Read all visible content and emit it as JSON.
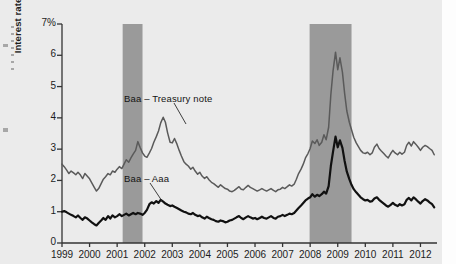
{
  "figure": {
    "background_color": "#ebebeb",
    "plot_background_color": "#ebebeb",
    "recession_band_color": "#9a9a9a",
    "axis_color": "#333333"
  },
  "axes": {
    "y_title": "Interest rate",
    "y_top_label": "7%",
    "y_tick_labels": [
      "0",
      "1",
      "2",
      "3",
      "4",
      "5",
      "6",
      "7%"
    ],
    "x_tick_labels": [
      "1999",
      "2000",
      "2001",
      "2002",
      "2003",
      "2004",
      "2005",
      "2006",
      "2007",
      "2008",
      "2009",
      "2010",
      "2011",
      "2012"
    ]
  },
  "annotations": [
    {
      "name": "baa-treasury-label",
      "text": "Baa – Treasury note",
      "x": 124,
      "y": 93
    },
    {
      "name": "baa-aaa-label",
      "text": "Baa – Aaa",
      "x": 124,
      "y": 173
    }
  ],
  "chart_data": {
    "type": "line",
    "title": "",
    "xlabel": "",
    "ylabel": "Interest rate",
    "xlim": [
      1999.0,
      2012.6
    ],
    "ylim": [
      0,
      7
    ],
    "yunit": "percent",
    "grid": false,
    "legend": "inline-annotations",
    "shaded_regions": [
      {
        "label": "recession",
        "start": 2001.2,
        "end": 2001.92,
        "color": "#9a9a9a"
      },
      {
        "label": "recession",
        "start": 2007.98,
        "end": 2009.5,
        "color": "#9a9a9a"
      }
    ],
    "series": [
      {
        "name": "Baa – Treasury note",
        "color": "#5a5a5a",
        "width": 1.5,
        "x": [
          1999.0,
          1999.08,
          1999.17,
          1999.25,
          1999.33,
          1999.42,
          1999.5,
          1999.58,
          1999.67,
          1999.75,
          1999.83,
          1999.92,
          2000.0,
          2000.08,
          2000.17,
          2000.25,
          2000.33,
          2000.42,
          2000.5,
          2000.58,
          2000.67,
          2000.75,
          2000.83,
          2000.92,
          2001.0,
          2001.08,
          2001.17,
          2001.25,
          2001.33,
          2001.42,
          2001.5,
          2001.58,
          2001.67,
          2001.75,
          2001.83,
          2001.92,
          2002.0,
          2002.08,
          2002.17,
          2002.25,
          2002.33,
          2002.42,
          2002.5,
          2002.58,
          2002.67,
          2002.75,
          2002.83,
          2002.92,
          2003.0,
          2003.08,
          2003.17,
          2003.25,
          2003.33,
          2003.42,
          2003.5,
          2003.58,
          2003.67,
          2003.75,
          2003.83,
          2003.92,
          2004.0,
          2004.08,
          2004.17,
          2004.25,
          2004.33,
          2004.42,
          2004.5,
          2004.58,
          2004.67,
          2004.75,
          2004.83,
          2004.92,
          2005.0,
          2005.08,
          2005.17,
          2005.25,
          2005.33,
          2005.42,
          2005.5,
          2005.58,
          2005.67,
          2005.75,
          2005.83,
          2005.92,
          2006.0,
          2006.08,
          2006.17,
          2006.25,
          2006.33,
          2006.42,
          2006.5,
          2006.58,
          2006.67,
          2006.75,
          2006.83,
          2006.92,
          2007.0,
          2007.08,
          2007.17,
          2007.25,
          2007.33,
          2007.42,
          2007.5,
          2007.58,
          2007.67,
          2007.75,
          2007.83,
          2007.92,
          2008.0,
          2008.08,
          2008.17,
          2008.25,
          2008.33,
          2008.42,
          2008.5,
          2008.58,
          2008.67,
          2008.75,
          2008.83,
          2008.92,
          2009.0,
          2009.08,
          2009.17,
          2009.25,
          2009.33,
          2009.42,
          2009.5,
          2009.58,
          2009.67,
          2009.75,
          2009.83,
          2009.92,
          2010.0,
          2010.08,
          2010.17,
          2010.25,
          2010.33,
          2010.42,
          2010.5,
          2010.58,
          2010.67,
          2010.75,
          2010.83,
          2010.92,
          2011.0,
          2011.08,
          2011.17,
          2011.25,
          2011.33,
          2011.42,
          2011.5,
          2011.58,
          2011.67,
          2011.75,
          2011.83,
          2011.92,
          2012.0,
          2012.08,
          2012.17,
          2012.25,
          2012.33,
          2012.42,
          2012.5
        ],
        "y": [
          2.52,
          2.44,
          2.33,
          2.22,
          2.3,
          2.24,
          2.18,
          2.26,
          2.17,
          2.06,
          2.22,
          2.13,
          2.05,
          1.92,
          1.78,
          1.66,
          1.74,
          1.9,
          2.04,
          2.12,
          2.22,
          2.18,
          2.3,
          2.26,
          2.36,
          2.44,
          2.38,
          2.52,
          2.66,
          2.58,
          2.72,
          2.84,
          2.96,
          3.24,
          3.06,
          2.88,
          2.78,
          2.74,
          2.88,
          3.02,
          3.22,
          3.4,
          3.58,
          3.84,
          4.02,
          3.86,
          3.52,
          3.22,
          3.2,
          3.34,
          3.16,
          2.96,
          2.78,
          2.6,
          2.52,
          2.46,
          2.36,
          2.42,
          2.3,
          2.2,
          2.26,
          2.14,
          2.06,
          2.12,
          2.02,
          1.94,
          1.9,
          1.84,
          1.78,
          1.86,
          1.8,
          1.74,
          1.72,
          1.66,
          1.64,
          1.68,
          1.74,
          1.8,
          1.72,
          1.7,
          1.78,
          1.84,
          1.78,
          1.74,
          1.7,
          1.66,
          1.7,
          1.74,
          1.7,
          1.66,
          1.7,
          1.74,
          1.68,
          1.64,
          1.7,
          1.72,
          1.78,
          1.74,
          1.8,
          1.86,
          1.82,
          1.88,
          2.04,
          2.22,
          2.36,
          2.52,
          2.72,
          2.86,
          3.02,
          3.26,
          3.18,
          3.3,
          3.12,
          3.22,
          3.46,
          3.3,
          3.7,
          4.74,
          5.5,
          6.1,
          5.54,
          5.92,
          5.46,
          4.78,
          4.22,
          3.86,
          3.62,
          3.38,
          3.2,
          3.08,
          2.96,
          2.88,
          2.86,
          2.9,
          2.82,
          2.88,
          3.06,
          3.16,
          3.02,
          2.94,
          2.86,
          2.78,
          2.72,
          2.86,
          2.96,
          2.88,
          2.82,
          2.9,
          2.84,
          2.9,
          3.12,
          3.22,
          3.1,
          3.24,
          3.16,
          3.06,
          2.96,
          3.06,
          3.12,
          3.08,
          3.02,
          2.96,
          2.82
        ]
      },
      {
        "name": "Baa – Aaa",
        "color": "#111111",
        "width": 2.2,
        "x": [
          1999.0,
          1999.08,
          1999.17,
          1999.25,
          1999.33,
          1999.42,
          1999.5,
          1999.58,
          1999.67,
          1999.75,
          1999.83,
          1999.92,
          2000.0,
          2000.08,
          2000.17,
          2000.25,
          2000.33,
          2000.42,
          2000.5,
          2000.58,
          2000.67,
          2000.75,
          2000.83,
          2000.92,
          2001.0,
          2001.08,
          2001.17,
          2001.25,
          2001.33,
          2001.42,
          2001.5,
          2001.58,
          2001.67,
          2001.75,
          2001.83,
          2001.92,
          2002.0,
          2002.08,
          2002.17,
          2002.25,
          2002.33,
          2002.42,
          2002.5,
          2002.58,
          2002.67,
          2002.75,
          2002.83,
          2002.92,
          2003.0,
          2003.08,
          2003.17,
          2003.25,
          2003.33,
          2003.42,
          2003.5,
          2003.58,
          2003.67,
          2003.75,
          2003.83,
          2003.92,
          2004.0,
          2004.08,
          2004.17,
          2004.25,
          2004.33,
          2004.42,
          2004.5,
          2004.58,
          2004.67,
          2004.75,
          2004.83,
          2004.92,
          2005.0,
          2005.08,
          2005.17,
          2005.25,
          2005.33,
          2005.42,
          2005.5,
          2005.58,
          2005.67,
          2005.75,
          2005.83,
          2005.92,
          2006.0,
          2006.08,
          2006.17,
          2006.25,
          2006.33,
          2006.42,
          2006.5,
          2006.58,
          2006.67,
          2006.75,
          2006.83,
          2006.92,
          2007.0,
          2007.08,
          2007.17,
          2007.25,
          2007.33,
          2007.42,
          2007.5,
          2007.58,
          2007.67,
          2007.75,
          2007.83,
          2007.92,
          2008.0,
          2008.08,
          2008.17,
          2008.25,
          2008.33,
          2008.42,
          2008.5,
          2008.58,
          2008.67,
          2008.75,
          2008.83,
          2008.92,
          2009.0,
          2009.08,
          2009.17,
          2009.25,
          2009.33,
          2009.42,
          2009.5,
          2009.58,
          2009.67,
          2009.75,
          2009.83,
          2009.92,
          2010.0,
          2010.08,
          2010.17,
          2010.25,
          2010.33,
          2010.42,
          2010.5,
          2010.58,
          2010.67,
          2010.75,
          2010.83,
          2010.92,
          2011.0,
          2011.08,
          2011.17,
          2011.25,
          2011.33,
          2011.42,
          2011.5,
          2011.58,
          2011.67,
          2011.75,
          2011.83,
          2011.92,
          2012.0,
          2012.08,
          2012.17,
          2012.25,
          2012.33,
          2012.42,
          2012.5
        ],
        "y": [
          1.0,
          1.02,
          0.98,
          0.94,
          0.9,
          0.86,
          0.82,
          0.88,
          0.8,
          0.74,
          0.82,
          0.78,
          0.72,
          0.66,
          0.6,
          0.56,
          0.64,
          0.72,
          0.8,
          0.74,
          0.86,
          0.78,
          0.88,
          0.82,
          0.86,
          0.92,
          0.86,
          0.9,
          0.94,
          0.88,
          0.92,
          0.96,
          0.92,
          0.96,
          0.94,
          0.9,
          0.96,
          1.06,
          1.24,
          1.3,
          1.26,
          1.34,
          1.28,
          1.38,
          1.32,
          1.26,
          1.22,
          1.18,
          1.2,
          1.16,
          1.12,
          1.08,
          1.04,
          1.0,
          0.98,
          0.94,
          0.92,
          0.96,
          0.9,
          0.86,
          0.88,
          0.82,
          0.78,
          0.84,
          0.8,
          0.76,
          0.74,
          0.7,
          0.68,
          0.72,
          0.7,
          0.66,
          0.68,
          0.72,
          0.74,
          0.78,
          0.82,
          0.86,
          0.8,
          0.76,
          0.82,
          0.86,
          0.82,
          0.78,
          0.8,
          0.76,
          0.8,
          0.84,
          0.8,
          0.78,
          0.82,
          0.86,
          0.8,
          0.78,
          0.84,
          0.86,
          0.9,
          0.86,
          0.9,
          0.94,
          0.92,
          0.96,
          1.04,
          1.12,
          1.2,
          1.28,
          1.36,
          1.42,
          1.46,
          1.56,
          1.48,
          1.54,
          1.5,
          1.56,
          1.64,
          1.58,
          1.82,
          2.46,
          2.92,
          3.4,
          3.06,
          3.28,
          3.04,
          2.62,
          2.28,
          2.04,
          1.86,
          1.72,
          1.62,
          1.54,
          1.46,
          1.4,
          1.36,
          1.38,
          1.32,
          1.34,
          1.42,
          1.46,
          1.38,
          1.32,
          1.26,
          1.2,
          1.16,
          1.22,
          1.28,
          1.22,
          1.18,
          1.24,
          1.2,
          1.24,
          1.38,
          1.44,
          1.36,
          1.46,
          1.4,
          1.32,
          1.26,
          1.34,
          1.4,
          1.36,
          1.3,
          1.24,
          1.14
        ]
      }
    ]
  }
}
